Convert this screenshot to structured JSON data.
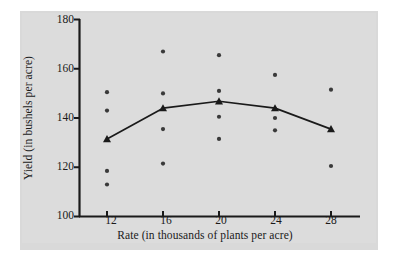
{
  "figure": {
    "background_color": "#ffffff",
    "panel_color": "#dcdcdc",
    "ink_color": "#1a1a1a"
  },
  "chart_data": {
    "type": "scatter",
    "title": "",
    "xlabel": "Rate (in thousands of plants per acre)",
    "ylabel": "Yield (in bushels per acre)",
    "xlim": [
      10,
      30
    ],
    "ylim": [
      100,
      180
    ],
    "xticks": [
      12,
      16,
      20,
      24,
      28
    ],
    "yticks": [
      100,
      120,
      140,
      160,
      180
    ],
    "xtick_labels": [
      "12",
      "16",
      "20",
      "24",
      "28"
    ],
    "ytick_labels": [
      "100",
      "120",
      "140",
      "160",
      "180"
    ],
    "grid": false,
    "legend": null,
    "series": [
      {
        "name": "Observed yields",
        "marker": "circle",
        "color": "#3a3a3a",
        "points": [
          {
            "x": 12,
            "y": 150.5
          },
          {
            "x": 12,
            "y": 143.0
          },
          {
            "x": 12,
            "y": 118.5
          },
          {
            "x": 12,
            "y": 113.0
          },
          {
            "x": 16,
            "y": 167.0
          },
          {
            "x": 16,
            "y": 150.0
          },
          {
            "x": 16,
            "y": 135.5
          },
          {
            "x": 16,
            "y": 121.5
          },
          {
            "x": 20,
            "y": 165.5
          },
          {
            "x": 20,
            "y": 151.0
          },
          {
            "x": 20,
            "y": 140.5
          },
          {
            "x": 20,
            "y": 131.5
          },
          {
            "x": 24,
            "y": 157.5
          },
          {
            "x": 24,
            "y": 140.0
          },
          {
            "x": 24,
            "y": 135.0
          },
          {
            "x": 28,
            "y": 151.5
          },
          {
            "x": 28,
            "y": 120.5
          }
        ]
      },
      {
        "name": "Mean yield",
        "marker": "triangle",
        "color": "#1a1a1a",
        "line": true,
        "points": [
          {
            "x": 12,
            "y": 131.5
          },
          {
            "x": 16,
            "y": 144.0
          },
          {
            "x": 20,
            "y": 146.8
          },
          {
            "x": 24,
            "y": 144.0
          },
          {
            "x": 28,
            "y": 135.5
          }
        ]
      }
    ]
  }
}
